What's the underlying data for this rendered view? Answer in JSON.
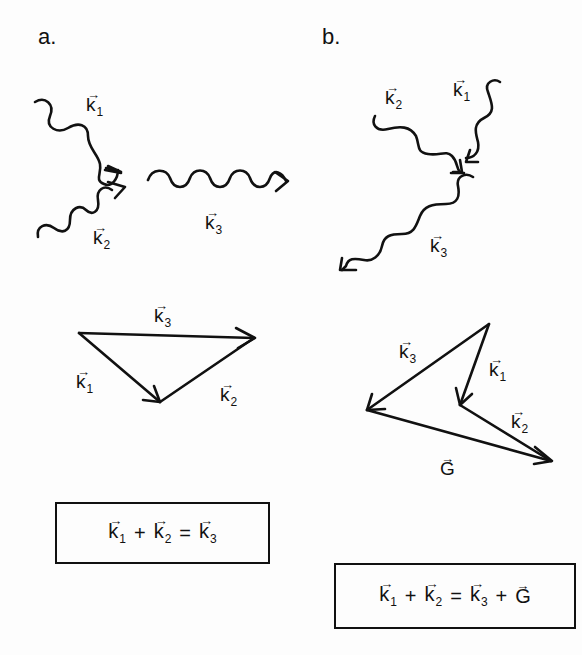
{
  "panels": {
    "a": {
      "label": "a.",
      "wave_labels": {
        "k1": {
          "base": "k",
          "sub": "1"
        },
        "k2": {
          "base": "k",
          "sub": "2"
        },
        "k3": {
          "base": "k",
          "sub": "3"
        }
      },
      "triangle_labels": {
        "k1": {
          "base": "k",
          "sub": "1"
        },
        "k2": {
          "base": "k",
          "sub": "2"
        },
        "k3": {
          "base": "k",
          "sub": "3"
        }
      },
      "equation": {
        "terms": [
          {
            "base": "k",
            "sub": "1"
          },
          {
            "op": "+"
          },
          {
            "base": "k",
            "sub": "2"
          },
          {
            "op": "="
          },
          {
            "base": "k",
            "sub": "3"
          }
        ],
        "text": "k1 + k2 = k3"
      }
    },
    "b": {
      "label": "b.",
      "wave_labels": {
        "k1": {
          "base": "k",
          "sub": "1"
        },
        "k2": {
          "base": "k",
          "sub": "2"
        },
        "k3": {
          "base": "k",
          "sub": "3"
        }
      },
      "triangle_labels": {
        "k1": {
          "base": "k",
          "sub": "1"
        },
        "k2": {
          "base": "k",
          "sub": "2"
        },
        "k3": {
          "base": "k",
          "sub": "3"
        },
        "G": {
          "base": "G",
          "sub": ""
        }
      },
      "equation": {
        "terms": [
          {
            "base": "k",
            "sub": "1"
          },
          {
            "op": "+"
          },
          {
            "base": "k",
            "sub": "2"
          },
          {
            "op": "="
          },
          {
            "base": "k",
            "sub": "3"
          },
          {
            "op": "+"
          },
          {
            "base": "G",
            "sub": ""
          }
        ],
        "text": "k1 + k2 = k3 + G"
      }
    }
  },
  "vector_arrow_glyph": "→",
  "colors": {
    "ink": "#111111",
    "background": "#fdfdfd"
  }
}
